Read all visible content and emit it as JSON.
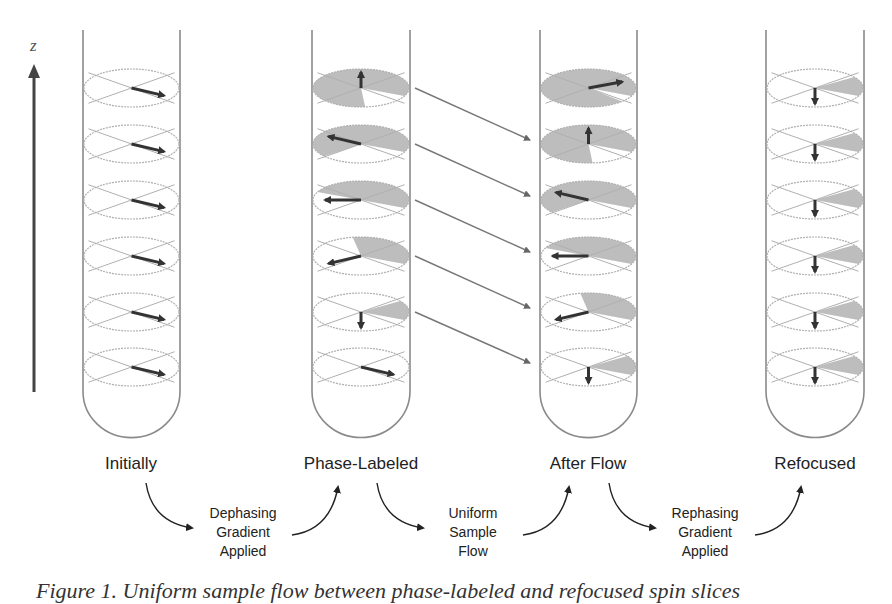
{
  "figure": {
    "axis_label": "z",
    "stages": [
      {
        "label": "Initially",
        "x": 131
      },
      {
        "label": "Phase-Labeled",
        "x": 361
      },
      {
        "label": "After Flow",
        "x": 588
      },
      {
        "label": "Refocused",
        "x": 815
      }
    ],
    "steps": [
      {
        "lines": [
          "Dephasing",
          "Gradient",
          "Applied"
        ],
        "x": 238
      },
      {
        "lines": [
          "Uniform",
          "Sample",
          "Flow"
        ],
        "x": 468
      },
      {
        "lines": [
          "Rephasing",
          "Gradient",
          "Applied"
        ],
        "x": 695
      }
    ],
    "caption": "Figure 1. Uniform sample flow between phase-labeled and refocused spin slices",
    "colors": {
      "tube_stroke": "#8a8a8a",
      "disk_stroke": "#b0b0b0",
      "shade_fill": "#bdbdbd",
      "arrow": "#333333",
      "flow_arrow": "#777777"
    },
    "tubes": [
      {
        "name": "initially",
        "left": 83,
        "right": 180,
        "slices": [
          {
            "angle": 25,
            "shade": 0
          },
          {
            "angle": 25,
            "shade": 0
          },
          {
            "angle": 25,
            "shade": 0
          },
          {
            "angle": 25,
            "shade": 0
          },
          {
            "angle": 25,
            "shade": 0
          },
          {
            "angle": 25,
            "shade": 0
          }
        ]
      },
      {
        "name": "phase-labeled",
        "left": 312,
        "right": 410,
        "slices": [
          {
            "angle": -90,
            "shade": 300
          },
          {
            "angle": -155,
            "shade": 245
          },
          {
            "angle": 180,
            "shade": 180
          },
          {
            "angle": 155,
            "shade": 125
          },
          {
            "angle": 90,
            "shade": 60
          },
          {
            "angle": 25,
            "shade": 0
          }
        ]
      },
      {
        "name": "after-flow",
        "left": 540,
        "right": 637,
        "slices": [
          {
            "angle": -20,
            "shade": 340
          },
          {
            "angle": -90,
            "shade": 300
          },
          {
            "angle": -155,
            "shade": 245
          },
          {
            "angle": 180,
            "shade": 180
          },
          {
            "angle": 155,
            "shade": 125
          },
          {
            "angle": 90,
            "shade": 60
          }
        ]
      },
      {
        "name": "refocused",
        "left": 766,
        "right": 864,
        "slices": [
          {
            "angle": 90,
            "shade": 60
          },
          {
            "angle": 90,
            "shade": 60
          },
          {
            "angle": 90,
            "shade": 60
          },
          {
            "angle": 90,
            "shade": 60
          },
          {
            "angle": 90,
            "shade": 60
          },
          {
            "angle": 90,
            "shade": 60
          }
        ]
      }
    ],
    "slice_y": [
      88,
      144,
      200,
      256,
      312,
      367
    ],
    "flow_arrows": [
      {
        "x1": 415,
        "y1": 88,
        "x2": 530,
        "y2": 140
      },
      {
        "x1": 415,
        "y1": 144,
        "x2": 530,
        "y2": 196
      },
      {
        "x1": 415,
        "y1": 200,
        "x2": 530,
        "y2": 252
      },
      {
        "x1": 415,
        "y1": 256,
        "x2": 530,
        "y2": 308
      },
      {
        "x1": 415,
        "y1": 312,
        "x2": 530,
        "y2": 363
      }
    ]
  }
}
